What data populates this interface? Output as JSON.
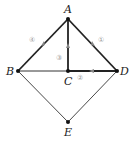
{
  "diagram": {
    "nodes": [
      {
        "id": "A",
        "label": "A",
        "x": 68,
        "y": 19
      },
      {
        "id": "B",
        "label": "B",
        "x": 18,
        "y": 71
      },
      {
        "id": "C",
        "label": "C",
        "x": 68,
        "y": 71
      },
      {
        "id": "D",
        "label": "D",
        "x": 117,
        "y": 71
      },
      {
        "id": "E",
        "label": "E",
        "x": 68,
        "y": 122
      }
    ],
    "edges": [
      {
        "from": "B",
        "to": "A",
        "label": "④",
        "directed": true,
        "bold": true
      },
      {
        "from": "C",
        "to": "A",
        "label": "③",
        "directed": true,
        "bold": true
      },
      {
        "from": "D",
        "to": "A",
        "label": "①",
        "directed": true,
        "bold": true
      },
      {
        "from": "D",
        "to": "C",
        "label": "②",
        "directed": true,
        "bold": true
      },
      {
        "from": "B",
        "to": "C",
        "label": "",
        "directed": false,
        "bold": false
      },
      {
        "from": "B",
        "to": "E",
        "label": "",
        "directed": false,
        "bold": false
      },
      {
        "from": "D",
        "to": "E",
        "label": "",
        "directed": false,
        "bold": false
      }
    ]
  }
}
